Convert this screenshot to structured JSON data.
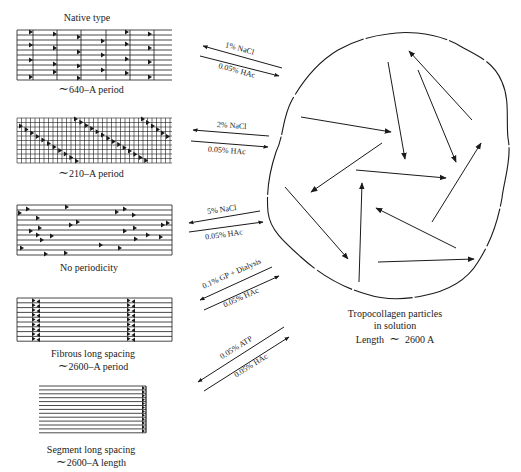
{
  "panels": [
    {
      "id": "native",
      "title": "Native type",
      "caption": "~640-A period",
      "caption_prefix": "∼",
      "caption_text": "640–A period"
    },
    {
      "id": "form-210",
      "caption_prefix": "∼",
      "caption_text": "210–A period"
    },
    {
      "id": "no-period",
      "caption_text": "No periodicity"
    },
    {
      "id": "fls",
      "caption_line1": "Fibrous long spacing",
      "caption_prefix": "∼",
      "caption_text": "2600–A period"
    },
    {
      "id": "sls",
      "caption_line1": "Segment long spacing",
      "caption_prefix": "∼",
      "caption_text": "2600–A length"
    }
  ],
  "reactions": [
    {
      "forward_label": "1% NaCl",
      "reverse_label": "0.05% HAc"
    },
    {
      "forward_label": "2% NaCl",
      "reverse_label": "0.05% HAc"
    },
    {
      "forward_label": "5% NaCl",
      "reverse_label": "0.05% HAc"
    },
    {
      "forward_label": "0.1% GP + Dialysis",
      "reverse_label": "0.05% HAc"
    },
    {
      "forward_label": "0.05% ATP",
      "reverse_label": "0.05% HAc"
    }
  ],
  "solution": {
    "line1": "Tropocollagen particles",
    "line2": "in solution",
    "line3_prefix": "Length",
    "line3_tilde": "∼",
    "line3_value": "2600 A"
  },
  "colors": {
    "ink": "#1a1a1a",
    "background": "#ffffff"
  }
}
